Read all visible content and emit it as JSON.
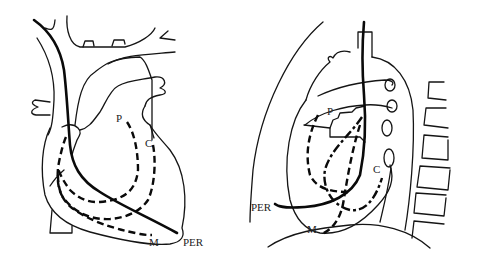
{
  "figure": {
    "panels": [
      {
        "id": "frontal-view",
        "view": "anterior (frontal) heart view",
        "labels": {
          "P": "P",
          "C": "C",
          "M": "M",
          "PER": "PER"
        }
      },
      {
        "id": "lateral-view",
        "view": "lateral chest view with spine",
        "labels": {
          "P": "P",
          "C": "C",
          "M": "M",
          "PER": "PER"
        }
      }
    ],
    "legend_meaning": {
      "solid_thick": "catheter path PER",
      "dashed": "catheter paths P, C, M"
    },
    "colors": {
      "line": "#0a0a0a",
      "background": "#ffffff"
    }
  }
}
